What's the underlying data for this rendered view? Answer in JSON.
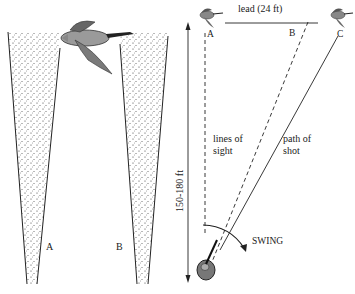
{
  "left_panel": {
    "cone_a_label": "A",
    "cone_b_label": "B"
  },
  "right_panel": {
    "lead_label": "lead (24 ft)",
    "point_a": "A",
    "point_b": "B",
    "point_c": "C",
    "distance_label": "150-180 ft",
    "lines_of_sight_line1": "lines of",
    "lines_of_sight_line2": "sight",
    "path_of_shot_line1": "path of",
    "path_of_shot_line2": "shot",
    "swing_label": "SWING"
  },
  "colors": {
    "ink": "#222222",
    "goose_body": "#8a8a8a",
    "goose_dark": "#333333",
    "shooter": "#777777"
  }
}
